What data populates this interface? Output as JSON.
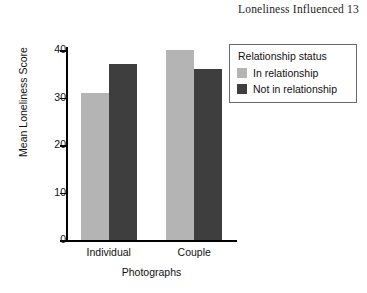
{
  "running_head": "Loneliness Influenced 13",
  "chart_data": {
    "type": "bar",
    "title": "",
    "xlabel": "Photographs",
    "ylabel": "Mean Loneliness Score",
    "categories": [
      "Individual",
      "Couple"
    ],
    "series": [
      {
        "name": "In relationship",
        "values": [
          31,
          40
        ],
        "color": "#b4b4b4"
      },
      {
        "name": "Not in relationship",
        "values": [
          37,
          36
        ],
        "color": "#3e3e3e"
      }
    ],
    "ylim": [
      0,
      42
    ],
    "yticks": [
      0,
      10,
      20,
      30,
      40
    ],
    "ytick_labels": [
      "0",
      "10",
      "20",
      "30",
      "40"
    ],
    "grid": false,
    "legend_position": "upper-right",
    "legend_title": "Relationship status"
  }
}
